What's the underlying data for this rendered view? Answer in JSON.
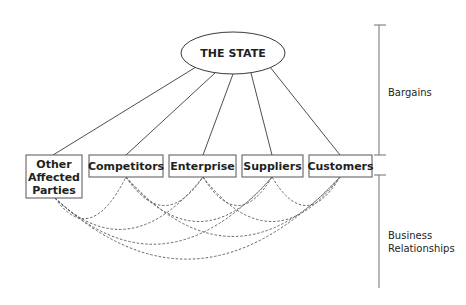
{
  "diagram": {
    "center": {
      "label": "THE STATE"
    },
    "parties": [
      {
        "id": "other",
        "lines": [
          "Other",
          "Affected",
          "Parties"
        ]
      },
      {
        "id": "competitors",
        "lines": [
          "Competitors"
        ]
      },
      {
        "id": "enterprise",
        "lines": [
          "Enterprise"
        ]
      },
      {
        "id": "suppliers",
        "lines": [
          "Suppliers"
        ]
      },
      {
        "id": "customers",
        "lines": [
          "Customers"
        ]
      }
    ],
    "brackets": {
      "upper": {
        "lines": [
          "Bargains"
        ]
      },
      "lower": {
        "lines": [
          "Business",
          "Relationships"
        ]
      }
    },
    "relationships": {
      "state_links": "solid lines from THE STATE to each party",
      "business_links": "dashed arcs between every pair of parties"
    }
  }
}
